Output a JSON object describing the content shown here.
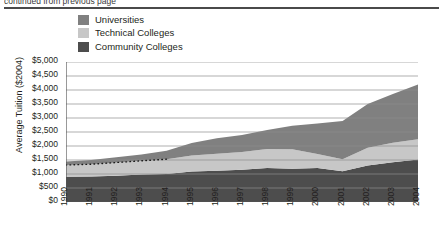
{
  "figure": {
    "cut_title": "continued from previous page",
    "y_axis_title": "Average  Tuition ($2004)"
  },
  "legend": {
    "items": [
      {
        "label": "Universities",
        "color": "#808080"
      },
      {
        "label": "Technical Colleges",
        "color": "#c7c7c7"
      },
      {
        "label": "Community Colleges",
        "color": "#4d4d4d"
      }
    ]
  },
  "chart_data": {
    "type": "area",
    "stacked": true,
    "title": "",
    "xlabel": "",
    "ylabel": "Average  Tuition ($2004)",
    "grid": true,
    "legend_position": "top-left",
    "categories": [
      "1990",
      "1991",
      "1992",
      "1993",
      "1994",
      "1995",
      "1996",
      "1997",
      "1998",
      "1999",
      "2000",
      "2001",
      "2002",
      "2003",
      "2004"
    ],
    "x": [
      1990,
      1991,
      1992,
      1993,
      1994,
      1995,
      1996,
      1997,
      1998,
      1999,
      2000,
      2001,
      2002,
      2003,
      2004
    ],
    "ylim": [
      0,
      5000
    ],
    "yticks": [
      0,
      500,
      1000,
      1500,
      2000,
      2500,
      3000,
      3500,
      4000,
      4500,
      5000
    ],
    "ytick_labels": [
      "$0",
      "$500",
      "$1,000",
      "$1,500",
      "$2,000",
      "$2,500",
      "$3,000",
      "$3,500",
      "$4,000",
      "$4,500",
      "$5,000"
    ],
    "series": [
      {
        "name": "Community Colleges",
        "color": "#4d4d4d",
        "values": [
          900,
          910,
          940,
          980,
          1000,
          1090,
          1120,
          1150,
          1210,
          1190,
          1210,
          1100,
          1300,
          1420,
          1520
        ]
      },
      {
        "name": "Technical Colleges",
        "color": "#c7c7c7",
        "values": [
          420,
          440,
          470,
          490,
          530,
          570,
          600,
          640,
          680,
          690,
          500,
          430,
          640,
          700,
          720
        ]
      },
      {
        "name": "Universities",
        "color": "#808080",
        "values": [
          130,
          150,
          190,
          230,
          300,
          450,
          560,
          600,
          680,
          840,
          1090,
          1360,
          1560,
          1740,
          1960
        ]
      }
    ],
    "totals": [
      1450,
      1500,
      1600,
      1700,
      1830,
      2110,
      2280,
      2390,
      2570,
      2720,
      2800,
      2890,
      3500,
      3860,
      4200
    ],
    "annotations": [
      {
        "type": "dotted-line",
        "note": "estimated data segment along top of Technical Colleges band, 1990-1994",
        "from_year": 1990,
        "to_year": 1994
      }
    ]
  }
}
